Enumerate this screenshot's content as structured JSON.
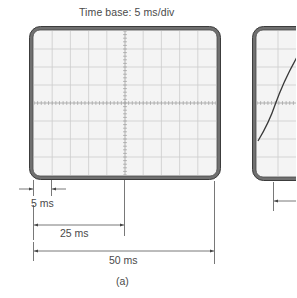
{
  "figure": {
    "title": "Time base:  5 ms/div",
    "caption": "(a)",
    "dimensions": [
      {
        "label": "5 ms",
        "span_divisions": 1
      },
      {
        "label": "25 ms",
        "span_divisions": 5
      },
      {
        "label": "50 ms",
        "span_divisions": 10
      }
    ],
    "screens": [
      {
        "name": "left-oscilloscope-screen",
        "divisions_x": 10,
        "divisions_y": 8,
        "trace": "none"
      },
      {
        "name": "right-oscilloscope-screen",
        "trace": "rising sine-like waveform (partially visible)"
      }
    ],
    "colors": {
      "frame": "#6f6f6f",
      "frame_outline": "#3a3a3a",
      "screen_bg": "#f3f3f3",
      "grid": "#c9c9c9",
      "trace": "#3a3a3a",
      "text": "#4a4a4a",
      "dimension_lines": "#555555"
    }
  }
}
